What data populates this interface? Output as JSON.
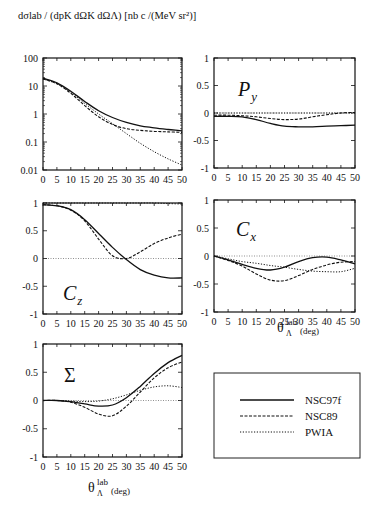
{
  "figure": {
    "ylabel_top": "dσlab / (dpK dΩK dΩΛ)  [nb c /(MeV sr²)]",
    "xlabel_main": "θ",
    "xlabel_sup": "lab",
    "xlabel_sub": "Λ",
    "xlabel_unit": "(deg)"
  },
  "legend": {
    "entries": [
      {
        "label": "NSC97f",
        "style": "solid"
      },
      {
        "label": "NSC89",
        "style": "dashed"
      },
      {
        "label": "PWIA",
        "style": "dotted"
      }
    ]
  },
  "chart_data": [
    {
      "type": "line",
      "title": "",
      "panel_label": "",
      "xlabel": "",
      "ylabel": "dσlab / (dpK dΩK dΩΛ) [nb c /(MeV sr²)]",
      "yscale": "log",
      "xlim": [
        0,
        50
      ],
      "ylim": [
        0.01,
        100
      ],
      "xticks": [
        0,
        5,
        10,
        15,
        20,
        25,
        30,
        35,
        40,
        45,
        50
      ],
      "yticks": [
        0.01,
        0.1,
        1,
        10,
        100
      ],
      "ytick_labels": [
        "0.01",
        "0.1",
        "1",
        "10",
        "100"
      ],
      "x": [
        0,
        5,
        10,
        15,
        20,
        25,
        30,
        35,
        40,
        45,
        50
      ],
      "series": [
        {
          "name": "NSC97f",
          "style": "solid",
          "values": [
            19,
            13,
            6.5,
            2.8,
            1.3,
            0.75,
            0.5,
            0.38,
            0.32,
            0.28,
            0.25
          ]
        },
        {
          "name": "NSC89",
          "style": "dashed",
          "values": [
            18,
            12,
            5.5,
            2.0,
            0.8,
            0.42,
            0.3,
            0.26,
            0.24,
            0.23,
            0.22
          ]
        },
        {
          "name": "PWIA",
          "style": "dotted",
          "values": [
            18,
            12,
            6.0,
            2.4,
            1.0,
            0.45,
            0.2,
            0.09,
            0.045,
            0.025,
            0.015
          ]
        }
      ]
    },
    {
      "type": "line",
      "panel_label": "Py",
      "xlim": [
        0,
        50
      ],
      "ylim": [
        -1,
        1
      ],
      "xticks": [
        0,
        5,
        10,
        15,
        20,
        25,
        30,
        35,
        40,
        45,
        50
      ],
      "yticks": [
        -1,
        -0.5,
        0,
        0.5,
        1
      ],
      "ytick_labels": [
        "-1",
        "-0.5",
        "0",
        "0.5",
        "1"
      ],
      "x": [
        0,
        5,
        10,
        15,
        20,
        25,
        30,
        35,
        40,
        45,
        50
      ],
      "series": [
        {
          "name": "NSC97f",
          "style": "solid",
          "values": [
            -0.06,
            -0.06,
            -0.07,
            -0.12,
            -0.19,
            -0.24,
            -0.25,
            -0.25,
            -0.24,
            -0.23,
            -0.22
          ]
        },
        {
          "name": "NSC89",
          "style": "dashed",
          "values": [
            -0.04,
            -0.04,
            -0.05,
            -0.07,
            -0.1,
            -0.12,
            -0.11,
            -0.07,
            -0.03,
            0.0,
            0.01
          ]
        },
        {
          "name": "PWIA",
          "style": "dotted",
          "values": [
            0,
            0,
            0,
            0,
            0,
            0,
            0,
            0,
            0,
            0,
            0
          ]
        }
      ]
    },
    {
      "type": "line",
      "panel_label": "Cz",
      "xlim": [
        0,
        50
      ],
      "ylim": [
        -1,
        1
      ],
      "xticks": [
        0,
        5,
        10,
        15,
        20,
        25,
        30,
        35,
        40,
        45,
        50
      ],
      "yticks": [
        -1,
        -0.5,
        0,
        0.5,
        1
      ],
      "ytick_labels": [
        "-1",
        "-0.5",
        "0",
        "0.5",
        "1"
      ],
      "x": [
        0,
        5,
        10,
        15,
        20,
        25,
        30,
        35,
        40,
        45,
        50
      ],
      "series": [
        {
          "name": "NSC97f",
          "style": "solid",
          "values": [
            0.97,
            0.95,
            0.88,
            0.7,
            0.45,
            0.2,
            -0.02,
            -0.2,
            -0.3,
            -0.35,
            -0.35
          ]
        },
        {
          "name": "NSC89",
          "style": "dashed",
          "values": [
            0.97,
            0.95,
            0.87,
            0.68,
            0.35,
            0.05,
            0.0,
            0.12,
            0.27,
            0.37,
            0.44
          ]
        },
        {
          "name": "PWIA",
          "style": "dotted",
          "values": [
            1,
            1,
            1,
            1,
            1,
            1,
            1,
            1,
            1,
            0.99,
            0.98
          ]
        }
      ]
    },
    {
      "type": "line",
      "panel_label": "Cx",
      "xlim": [
        0,
        50
      ],
      "ylim": [
        -1,
        1
      ],
      "xticks": [
        0,
        5,
        10,
        15,
        20,
        25,
        30,
        35,
        40,
        45,
        50
      ],
      "yticks": [
        -1,
        -0.5,
        0,
        0.5,
        1
      ],
      "ytick_labels": [
        "-1",
        "-0.5",
        "0",
        "0.5",
        "1"
      ],
      "x": [
        0,
        5,
        10,
        15,
        20,
        25,
        30,
        35,
        40,
        45,
        50
      ],
      "series": [
        {
          "name": "NSC97f",
          "style": "solid",
          "values": [
            0,
            -0.07,
            -0.15,
            -0.22,
            -0.25,
            -0.2,
            -0.1,
            -0.03,
            -0.02,
            -0.07,
            -0.14
          ]
        },
        {
          "name": "NSC89",
          "style": "dashed",
          "values": [
            0,
            -0.08,
            -0.18,
            -0.32,
            -0.43,
            -0.44,
            -0.35,
            -0.24,
            -0.16,
            -0.11,
            -0.1
          ]
        },
        {
          "name": "PWIA",
          "style": "dotted",
          "values": [
            0,
            -0.05,
            -0.1,
            -0.13,
            -0.17,
            -0.2,
            -0.24,
            -0.27,
            -0.28,
            -0.28,
            -0.22
          ]
        }
      ]
    },
    {
      "type": "line",
      "panel_label": "Σ",
      "xlim": [
        0,
        50
      ],
      "ylim": [
        -1,
        1
      ],
      "xticks": [
        0,
        5,
        10,
        15,
        20,
        25,
        30,
        35,
        40,
        45,
        50
      ],
      "yticks": [
        -1,
        -0.5,
        0,
        0.5,
        1
      ],
      "ytick_labels": [
        "-1",
        "-0.5",
        "0",
        "0.5",
        "1"
      ],
      "x": [
        0,
        5,
        10,
        15,
        20,
        25,
        30,
        35,
        40,
        45,
        50
      ],
      "series": [
        {
          "name": "NSC97f",
          "style": "solid",
          "values": [
            0,
            0,
            -0.02,
            -0.06,
            -0.1,
            -0.08,
            0.05,
            0.25,
            0.48,
            0.67,
            0.8
          ]
        },
        {
          "name": "NSC89",
          "style": "dashed",
          "values": [
            0,
            0,
            -0.03,
            -0.12,
            -0.24,
            -0.27,
            -0.1,
            0.15,
            0.4,
            0.58,
            0.68
          ]
        },
        {
          "name": "PWIA",
          "style": "dotted",
          "values": [
            0,
            0,
            -0.01,
            -0.02,
            -0.01,
            0.03,
            0.1,
            0.18,
            0.24,
            0.26,
            0.23
          ]
        }
      ]
    }
  ]
}
